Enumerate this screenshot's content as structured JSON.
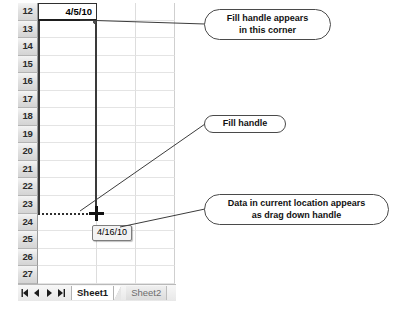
{
  "spreadsheet": {
    "rows": [
      {
        "header": "12",
        "cells": [
          "4/5/10",
          "",
          ""
        ],
        "selected_index": 0
      },
      {
        "header": "13",
        "cells": [
          "",
          "",
          ""
        ]
      },
      {
        "header": "14",
        "cells": [
          "",
          "",
          ""
        ]
      },
      {
        "header": "15",
        "cells": [
          "",
          "",
          ""
        ]
      },
      {
        "header": "16",
        "cells": [
          "",
          "",
          ""
        ]
      },
      {
        "header": "17",
        "cells": [
          "",
          "",
          ""
        ]
      },
      {
        "header": "18",
        "cells": [
          "",
          "",
          ""
        ]
      },
      {
        "header": "19",
        "cells": [
          "",
          "",
          ""
        ]
      },
      {
        "header": "20",
        "cells": [
          "",
          "",
          ""
        ]
      },
      {
        "header": "21",
        "cells": [
          "",
          "",
          ""
        ]
      },
      {
        "header": "22",
        "cells": [
          "",
          "",
          ""
        ]
      },
      {
        "header": "23",
        "cells": [
          "",
          "",
          ""
        ]
      },
      {
        "header": "24",
        "cells": [
          "",
          "",
          ""
        ]
      },
      {
        "header": "25",
        "cells": [
          "",
          "",
          ""
        ]
      },
      {
        "header": "26",
        "cells": [
          "",
          "",
          ""
        ]
      },
      {
        "header": "27",
        "cells": [
          "",
          "",
          ""
        ]
      }
    ],
    "active_cell_value": "4/5/10",
    "drag_tooltip_value": "4/16/10",
    "fill_handle_icon": "fill-handle-dot-icon",
    "cursor_icon": "crosshair-cursor-icon"
  },
  "tabbar": {
    "nav": [
      {
        "name": "first-sheet-button",
        "icon": "first-arrow-icon"
      },
      {
        "name": "previous-sheet-button",
        "icon": "left-arrow-icon"
      },
      {
        "name": "next-sheet-button",
        "icon": "right-arrow-icon"
      },
      {
        "name": "last-sheet-button",
        "icon": "last-arrow-icon"
      }
    ],
    "tabs": [
      {
        "label": "Sheet1",
        "active": true
      },
      {
        "label": "Sheet2",
        "active": false
      }
    ]
  },
  "callouts": [
    {
      "id": "fill-handle-corner",
      "line1": "Fill handle appears",
      "line2": "in this corner"
    },
    {
      "id": "fill-handle",
      "line1": "Fill handle",
      "line2": ""
    },
    {
      "id": "drag-down-handle",
      "line1": "Data in current location appears",
      "line2": "as drag down handle"
    }
  ],
  "caption": {
    "text": ""
  },
  "colors": {
    "grid_line": "#e4e4e4",
    "row_header_bg": "#e2e2e2",
    "selection_border": "#2f2f2f",
    "callout_border": "#4a4a4a",
    "tooltip_bg": "#f2f2f2"
  }
}
